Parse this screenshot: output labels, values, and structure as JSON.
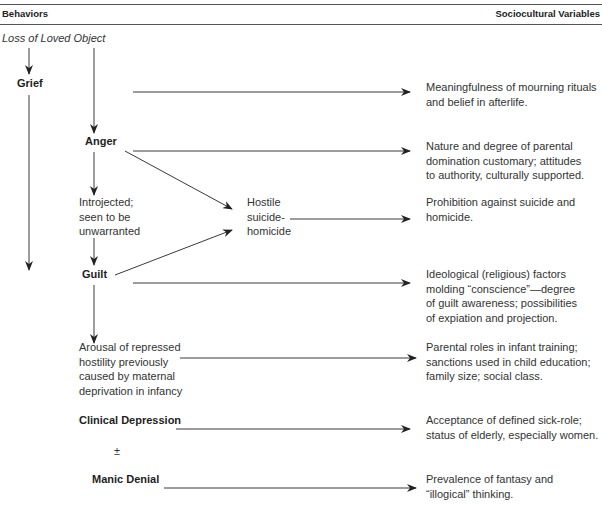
{
  "header": {
    "left_title": "Behaviors",
    "right_title": "Sociocultural Variables"
  },
  "root": "Loss of Loved Object",
  "behaviors": {
    "grief": "Grief",
    "anger": "Anger",
    "introjected": [
      "Introjected;",
      "seen to be",
      "unwarranted"
    ],
    "hostile": [
      "Hostile",
      "suicide-",
      "homicide"
    ],
    "guilt": "Guilt",
    "arousal": [
      "Arousal of repressed",
      "hostility previously",
      "caused by maternal",
      "deprivation in infancy"
    ],
    "clinical_depression": "Clinical Depression",
    "plus_minus": "±",
    "manic_denial": "Manic Denial"
  },
  "variables": [
    [
      "Meaningfulness of mourning rituals",
      "and belief in afterlife."
    ],
    [
      "Nature and degree of parental",
      "domination customary; attitudes",
      "to authority, culturally supported."
    ],
    [
      "Prohibition against suicide and",
      "homicide."
    ],
    [
      "Ideological (religious) factors",
      "molding “conscience”—degree",
      "of guilt awareness; possibilities",
      "of expiation and projection."
    ],
    [
      "Parental roles in infant training;",
      "sanctions used in child education;",
      "family size; social class."
    ],
    [
      "Acceptance of defined sick-role;",
      "status of elderly, especially women."
    ],
    [
      "Prevalence of fantasy and",
      "“illogical” thinking."
    ]
  ],
  "colors": {
    "line": "#3a3a3a",
    "text": "#333333"
  }
}
